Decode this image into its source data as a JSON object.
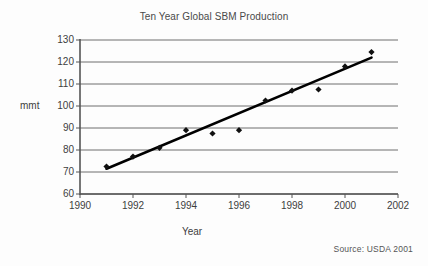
{
  "chart_data": {
    "type": "scatter",
    "title": "Ten Year Global SBM Production",
    "xlabel": "Year",
    "ylabel": "mmt",
    "xlim": [
      1990,
      2002
    ],
    "ylim": [
      60,
      130
    ],
    "xticks": [
      1990,
      1992,
      1994,
      1996,
      1998,
      2000,
      2002
    ],
    "xtick_labels": [
      "1990",
      "1992",
      "1994",
      "1996",
      "1998",
      "2000",
      "2002"
    ],
    "yticks": [
      60,
      70,
      80,
      90,
      100,
      110,
      120,
      130
    ],
    "ytick_labels": [
      "60",
      "70",
      "80",
      "90",
      "100",
      "110",
      "120",
      "130"
    ],
    "grid": "horizontal",
    "legend": "none",
    "marker": "diamond",
    "marker_color": "#111111",
    "gridline_color": "#6f6f6f",
    "axis_color": "#555555",
    "trendline_color": "#000000",
    "series": [
      {
        "name": "Global SBM Production",
        "x": [
          1991,
          1992,
          1993,
          1994,
          1995,
          1996,
          1997,
          1998,
          1999,
          2000,
          2001
        ],
        "values": [
          72.5,
          77.0,
          81.0,
          89.0,
          87.5,
          89.0,
          102.5,
          107.0,
          107.5,
          118.0,
          124.5
        ]
      }
    ],
    "trendline": {
      "name": "linear fit",
      "x": [
        1991,
        2001
      ],
      "values": [
        71.5,
        122.0
      ]
    },
    "annotations": [
      {
        "name": "source",
        "text": "Source: USDA 2001"
      }
    ]
  }
}
